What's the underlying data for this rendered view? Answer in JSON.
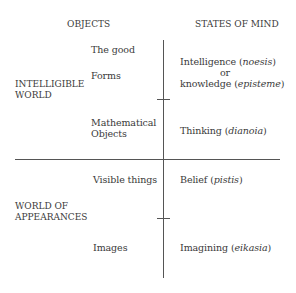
{
  "headers": {
    "objects": "OBJECTS",
    "states_of_mind": "STATES OF MIND"
  },
  "worlds": {
    "intelligible": [
      "INTELLIGIBLE",
      "WORLD"
    ],
    "appearances": [
      "WORLD OF",
      "APPEARANCES"
    ]
  },
  "objects": {
    "the_good": "The good",
    "forms": "Forms",
    "mathematical": [
      "Mathematical",
      "Objects"
    ],
    "visible_things": "Visible things",
    "images": "Images"
  },
  "states": {
    "intelligence": {
      "text": "Intelligence (",
      "term": "noesis",
      "close": ")"
    },
    "or": "or",
    "knowledge": {
      "text": "knowledge (",
      "term": "episteme",
      "close": ")"
    },
    "thinking": {
      "text": "Thinking (",
      "term": "dianoia",
      "close": ")"
    },
    "belief": {
      "text": "Belief (",
      "term": "pistis",
      "close": ")"
    },
    "imagining": {
      "text": "Imagining (",
      "term": "eikasia",
      "close": ")"
    }
  },
  "colors": {
    "text": "#3a3a3a",
    "lines": "#555555",
    "background": "#ffffff"
  }
}
